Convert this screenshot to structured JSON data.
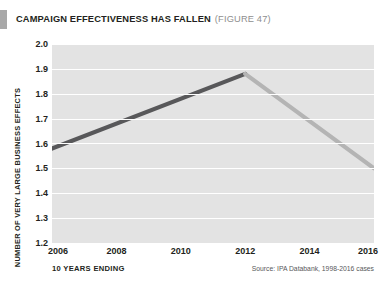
{
  "title": {
    "main": "CAMPAIGN EFFECTIVENESS HAS FALLEN",
    "figure": "(FIGURE 47)",
    "accent_color": "#a8a8a8"
  },
  "footer": {
    "x_axis_title": "10 YEARS ENDING",
    "source": "Source: IPA Databank, 1998-2016 cases"
  },
  "chart_data": {
    "type": "line",
    "title": "CAMPAIGN EFFECTIVENESS HAS FALLEN",
    "subtitle": "(FIGURE 47)",
    "xlabel": "10 YEARS ENDING",
    "ylabel": "NUMBER OF VERY LARGE BUSINESS EFFECTS",
    "source": "Source: IPA Databank, 1998-2016 cases",
    "x": [
      2006,
      2008,
      2012,
      2016
    ],
    "values": [
      1.58,
      1.7,
      1.88,
      1.5
    ],
    "series": [
      {
        "name": "Number of very large business effects",
        "x": [
          2006,
          2008,
          2012,
          2016
        ],
        "values": [
          1.58,
          1.7,
          1.88,
          1.5
        ]
      }
    ],
    "x_ticks": [
      2006,
      2008,
      2010,
      2012,
      2014,
      2016
    ],
    "x_tick_labels": [
      "2006",
      "2008",
      "2010",
      "2012",
      "2014",
      "2016"
    ],
    "y_ticks": [
      1.2,
      1.3,
      1.4,
      1.5,
      1.6,
      1.7,
      1.8,
      1.9,
      2.0
    ],
    "y_tick_labels": [
      "2.0",
      "1.9",
      "1.8",
      "1.7",
      "1.6",
      "1.5",
      "1.4",
      "1.3",
      "1.2"
    ],
    "xlim": [
      2006,
      2016
    ],
    "ylim": [
      1.2,
      2.0
    ],
    "grid": true,
    "grid_color": "#ffffff",
    "plot_background": "#e3e3e3",
    "legend": null,
    "line_segments": [
      {
        "from_x": 2006,
        "from_y": 1.58,
        "to_x": 2012,
        "to_y": 1.88,
        "color": "#58585a",
        "note": "rising segment, dark grey"
      },
      {
        "from_x": 2012,
        "from_y": 1.88,
        "to_x": 2016,
        "to_y": 1.5,
        "color": "#b4b4b4",
        "note": "falling segment, light grey"
      }
    ]
  }
}
